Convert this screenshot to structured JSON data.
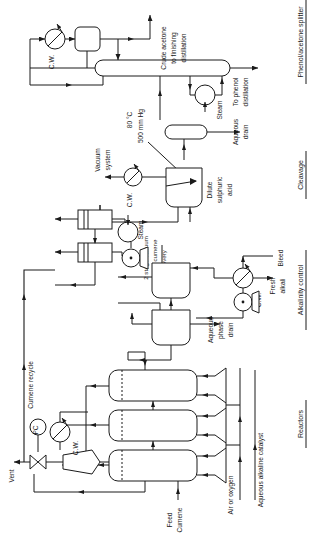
{
  "diagram": {
    "background": "#ffffff",
    "line_color": "#1a1a1a"
  },
  "sections": [
    {
      "id": "splitter",
      "label": "Phenol/acetone splitter"
    },
    {
      "id": "cleavage",
      "label": "Cleavage"
    },
    {
      "id": "alkalinity",
      "label": "Alkalinity control"
    },
    {
      "id": "reactors",
      "label": "Reactors"
    }
  ],
  "streams": [
    {
      "id": "crude-acetone",
      "label": "Crude acetone\nto finishing\ndistillation"
    },
    {
      "id": "to-phenol",
      "label": "To phenol\ndistillation"
    },
    {
      "id": "aqueous-drain",
      "label": "Aqueous\ndrain"
    },
    {
      "id": "dilute-acid",
      "label": "Dilute\nsulphuric\nacid"
    },
    {
      "id": "vacuum-system",
      "label": "Vacuum\nsystem"
    },
    {
      "id": "bleed",
      "label": "Bleed"
    },
    {
      "id": "fresh-alkali",
      "label": "Fresh\nalkali"
    },
    {
      "id": "aqueous-phase-drain",
      "label": "Aqueous\nphase\ndrain"
    },
    {
      "id": "cumene-recycle",
      "label": "Cumene recycle"
    },
    {
      "id": "vent",
      "label": "Vent"
    },
    {
      "id": "feed-cumene",
      "label": "Feed\nCumene"
    },
    {
      "id": "air-oxygen",
      "label": "Air or oxygen"
    },
    {
      "id": "aqueous-catalyst",
      "label": "Aqueous alkaline catalyst"
    }
  ],
  "stream_lines": {
    "crude_acetone_l1": "Crude acetone",
    "crude_acetone_l2": "to finishing",
    "crude_acetone_l3": "distillation",
    "to_phenol_l1": "To phenol",
    "to_phenol_l2": "distillation",
    "aqueous_drain_l1": "Aqueous",
    "aqueous_drain_l2": "drain",
    "dilute_acid_l1": "Dilute",
    "dilute_acid_l2": "sulphuric",
    "dilute_acid_l3": "acid",
    "vacuum_l1": "Vacuum",
    "vacuum_l2": "system",
    "bleed": "Bleed",
    "fresh_alkali_l1": "Fresh",
    "fresh_alkali_l2": "alkali",
    "aq_phase_l1": "Aqueous",
    "aq_phase_l2": "phase",
    "aq_phase_l3": "drain",
    "cumene_recycle": "Cumene recycle",
    "vent": "Vent",
    "feed_l1": "Feed",
    "feed_l2": "Cumene",
    "air_oxygen": "Air or oxygen",
    "aq_catalyst": "Aqueous alkaline catalyst",
    "flash_l1": "2 stage vacuum",
    "flash_l2": "flash cumene",
    "flash_l3": "recovery"
  },
  "utilities": [
    {
      "id": "cw-condenser",
      "label": "C.W."
    },
    {
      "id": "cw-cleavage",
      "label": "C.W."
    },
    {
      "id": "cw-alkalinity",
      "label": "C.W."
    },
    {
      "id": "cw-reactor",
      "label": "C.W."
    },
    {
      "id": "steam-reboiler",
      "label": "Steam"
    },
    {
      "id": "steam-flash",
      "label": "Steam"
    }
  ],
  "utility_labels": {
    "cw": "C.W.",
    "steam": "Steam"
  },
  "equipment": {
    "flash_recovery_label": "2 stage vacuum flash cumene recovery",
    "pressure_controller": "PC"
  },
  "conditions": {
    "temperature": "80 °C",
    "pressure": "500 mm Hg"
  }
}
